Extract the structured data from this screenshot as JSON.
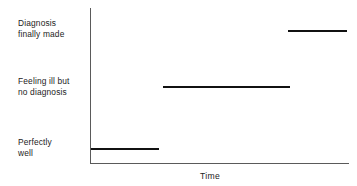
{
  "chart_data": {
    "type": "line",
    "title": "",
    "subtitle": "",
    "xlabel": "Time",
    "ylabel": "",
    "grid": false,
    "legend": false,
    "axis_style": "L-shaped (left and bottom spines only), no tick marks, no tick numbers",
    "y_categories": [
      "Perfectly\nwell",
      "Feeling ill but\nno diagnosis",
      "Diagnosis\nfinally made"
    ],
    "x": [
      0,
      0.28,
      0.28,
      0.77,
      0.77,
      1.0
    ],
    "y": [
      1,
      1,
      2,
      2,
      3,
      3
    ],
    "series": [
      {
        "name": "Illness trajectory",
        "style": "step-function, horizontal segments only (vertical risers not drawn)",
        "segments": [
          {
            "label": "Perfectly well",
            "level": 1,
            "x_start": 0.0,
            "x_end": 0.27,
            "color": "#111111"
          },
          {
            "label": "Feeling ill but no diagnosis",
            "level": 2,
            "x_start": 0.28,
            "x_end": 0.77,
            "color": "#111111"
          },
          {
            "label": "Diagnosis finally made",
            "level": 3,
            "x_start": 0.77,
            "x_end": 0.99,
            "color": "#111111"
          }
        ]
      }
    ],
    "xlim": [
      0,
      1
    ],
    "ylim": [
      0.5,
      3.5
    ],
    "colors": {
      "background": "#ffffff",
      "axis": "#5a5a5a",
      "line": "#111111",
      "text": "#232323"
    }
  },
  "labels": {
    "level3": "Diagnosis\nfinally made",
    "level2": "Feeling ill but\nno diagnosis",
    "level1": "Perfectly\nwell",
    "x_axis_title": "Time"
  }
}
